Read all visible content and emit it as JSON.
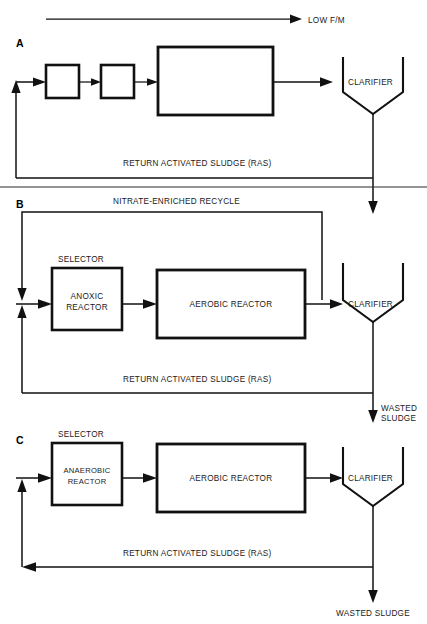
{
  "diagram": {
    "top_annotation": "LOW F/M",
    "panels": [
      {
        "letter": "A",
        "boxes": [
          {
            "name": "small-box-1",
            "label": ""
          },
          {
            "name": "small-box-2",
            "label": ""
          },
          {
            "name": "large-reactor",
            "label": ""
          }
        ],
        "clarifier_label": "CLARIFIER",
        "return_line_label": "RETURN ACTIVATED SLUDGE (RAS)"
      },
      {
        "letter": "B",
        "recycle_label": "NITRATE-ENRICHED RECYCLE",
        "selector_label": "SELECTOR",
        "selector_reactor_line1": "ANOXIC",
        "selector_reactor_line2": "REACTOR",
        "main_reactor_label": "AEROBIC REACTOR",
        "clarifier_label": "CLARIFIER",
        "return_line_label": "RETURN ACTIVATED SLUDGE (RAS)",
        "waste_label_line1": "WASTED",
        "waste_label_line2": "SLUDGE"
      },
      {
        "letter": "C",
        "selector_label": "SELECTOR",
        "selector_reactor_line1": "ANAEROBIC",
        "selector_reactor_line2": "REACTOR",
        "main_reactor_label": "AEROBIC REACTOR",
        "clarifier_label": "CLARIFIER",
        "return_line_label": "RETURN ACTIVATED SLUDGE (RAS)",
        "waste_label": "WASTED SLUDGE"
      }
    ],
    "colors": {
      "line": "#111111",
      "text": "#1a1a1a",
      "background": "#ffffff"
    }
  }
}
